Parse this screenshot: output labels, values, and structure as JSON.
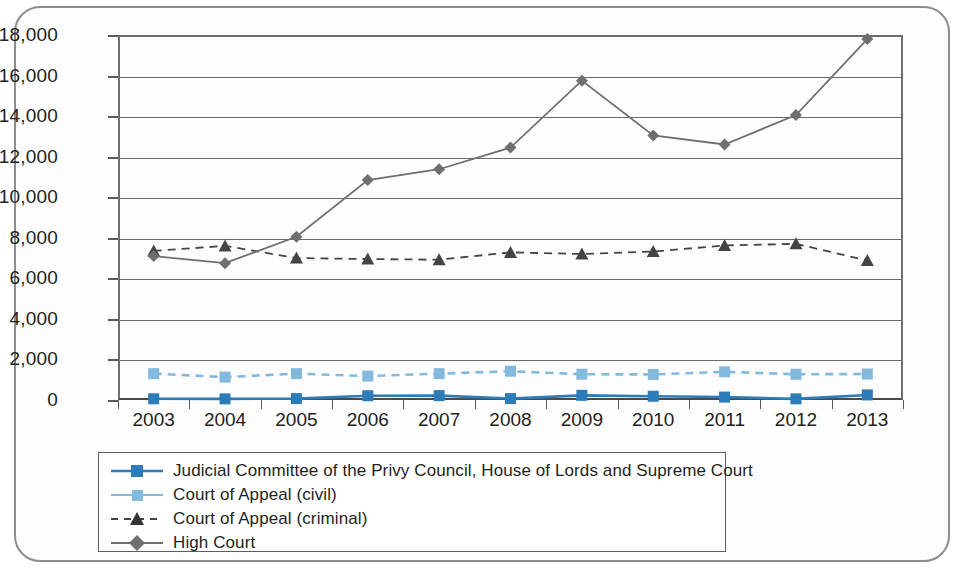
{
  "chart_data": {
    "type": "line",
    "title": "",
    "subtitle": "",
    "xlabel": "",
    "ylabel": "",
    "categories": [
      "2003",
      "2004",
      "2005",
      "2006",
      "2007",
      "2008",
      "2009",
      "2010",
      "2011",
      "2012",
      "2013"
    ],
    "ylim": [
      0,
      18000
    ],
    "ytick_labels": [
      "18,000",
      "16,000",
      "14,000",
      "12,000",
      "10,000",
      "8,000",
      "6,000",
      "4,000",
      "2,000",
      "0"
    ],
    "ytick_values": [
      18000,
      16000,
      14000,
      12000,
      10000,
      8000,
      6000,
      4000,
      2000,
      0
    ],
    "grid": true,
    "legend_position": "bottom",
    "series": [
      {
        "name": "Judicial Committee of the Privy Council, House of Lords and Supreme Court",
        "color": "#2b7cb8",
        "marker": "square",
        "dash": "solid",
        "values": [
          60,
          55,
          70,
          210,
          215,
          70,
          230,
          185,
          145,
          55,
          250
        ]
      },
      {
        "name": "Court of Appeal (civil)",
        "color": "#84b9de",
        "marker": "square",
        "dash": "dashed",
        "values": [
          1300,
          1130,
          1300,
          1180,
          1300,
          1420,
          1270,
          1260,
          1390,
          1270,
          1280
        ]
      },
      {
        "name": "Court of Appeal (criminal)",
        "color": "#444444",
        "marker": "triangle",
        "dash": "dashed",
        "values": [
          7350,
          7600,
          7000,
          6950,
          6920,
          7280,
          7200,
          7320,
          7620,
          7700,
          6880
        ]
      },
      {
        "name": "High Court",
        "color": "#6f6f6f",
        "marker": "diamond",
        "dash": "solid",
        "values": [
          7100,
          6750,
          8050,
          10850,
          11380,
          12450,
          15750,
          13050,
          12600,
          14050,
          17800
        ]
      }
    ]
  },
  "legend": {
    "items": [
      {
        "label": "Judicial Committee of the Privy Council, House of Lords and Supreme Court"
      },
      {
        "label": "Court of Appeal (civil)"
      },
      {
        "label": "Court of Appeal (criminal)"
      },
      {
        "label": "High Court"
      }
    ]
  }
}
